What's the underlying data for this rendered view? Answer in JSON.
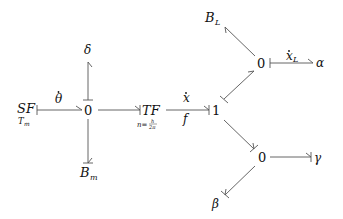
{
  "diagram": {
    "type": "bond-graph",
    "nodes": {
      "sf": {
        "label": "SF",
        "sub": "T_m",
        "sub_text": "T",
        "sub_idx": "m"
      },
      "j0_left": {
        "label": "0"
      },
      "delta": {
        "label": "δ"
      },
      "bm": {
        "label": "B",
        "sub": "m"
      },
      "tf": {
        "label": "TF",
        "param": "n=h/2π",
        "param_lhs": "n=",
        "param_num": "h",
        "param_den": "2π"
      },
      "j1": {
        "label": "1"
      },
      "j0_top": {
        "label": "0"
      },
      "bl": {
        "label": "B",
        "sub": "L"
      },
      "alpha": {
        "label": "α"
      },
      "j0_bottom": {
        "label": "0"
      },
      "gamma": {
        "label": "γ"
      },
      "beta": {
        "label": "β"
      }
    },
    "bonds": [
      {
        "from": "sf",
        "to": "j0_left",
        "label": "θ̇",
        "label_base": "θ"
      },
      {
        "from": "j0_left",
        "to": "delta"
      },
      {
        "from": "j0_left",
        "to": "bm"
      },
      {
        "from": "j0_left",
        "to": "tf"
      },
      {
        "from": "tf",
        "to": "j1",
        "label_top": "ẋ",
        "label_top_base": "x",
        "label_bottom": "f"
      },
      {
        "from": "j1",
        "to": "j0_top"
      },
      {
        "from": "j0_top",
        "to": "bl"
      },
      {
        "from": "j0_top",
        "to": "alpha",
        "label": "ẋ_L",
        "label_base": "x",
        "label_sub": "L"
      },
      {
        "from": "j1",
        "to": "j0_bottom"
      },
      {
        "from": "j0_bottom",
        "to": "gamma"
      },
      {
        "from": "j0_bottom",
        "to": "beta"
      }
    ]
  }
}
